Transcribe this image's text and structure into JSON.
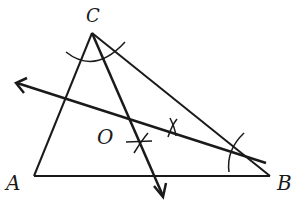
{
  "diagram": {
    "points": {
      "A": {
        "label": "A",
        "x": 34,
        "y": 176
      },
      "B": {
        "label": "B",
        "x": 270,
        "y": 176
      },
      "C": {
        "label": "C",
        "x": 92,
        "y": 33
      },
      "O": {
        "label": "O",
        "x": 130,
        "y": 122
      }
    },
    "labels": {
      "A": "A",
      "B": "B",
      "C": "C",
      "O": "O"
    },
    "colors": {
      "stroke": "#1a1a1a",
      "background": "#ffffff"
    }
  }
}
